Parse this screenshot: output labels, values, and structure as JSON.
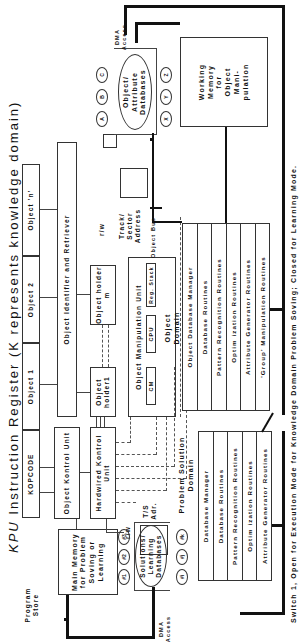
{
  "title": {
    "prefix": "KPU",
    "main": "Instruction Register (K represents knowledge domain)"
  },
  "instruction_register": {
    "fields": [
      "KOPCODE",
      "Object 1",
      "Object 2",
      "Object 'n'"
    ]
  },
  "program_store": {
    "label": "Program Store",
    "main_memory": "Main Memory for Problem Soving or Learning"
  },
  "units": {
    "object_kontrol_unit": "Object Kontrol Unit",
    "hardwired_kontrol_unit": "Hardwired Kontrol Unit",
    "object_identifier": "Object Identifier and Retriever",
    "object_holder_1": "Object holder1",
    "object_holder_m": "Object holder m",
    "object_manipulation_unit": "Object Manipulation Unit",
    "cm": "CM",
    "cpu": "CPU",
    "reg_stack": "Reg. Stack"
  },
  "io_labels": {
    "rw_top": "r/w",
    "track_sector": "Track/ Sector Address",
    "object_bus": "Object Bus",
    "rw_bottom": "r/w",
    "ts_adr": "T/S Adr.",
    "dma_top": "DMA Access",
    "dma_bottom": "DMA Access"
  },
  "object_attribute_db": {
    "label": "Object/ Attribute Databases",
    "ovals_top": [
      "A",
      "B",
      "C"
    ],
    "ovals_bottom": [
      "X",
      "Y",
      "Z"
    ]
  },
  "solutions_db": {
    "label": "Solutions/ Learning Databases",
    "ovals_top": [
      "#1",
      "#2",
      "#3"
    ],
    "ovals_bottom": [
      "#i",
      "#j",
      "#k"
    ]
  },
  "working_memory": {
    "label": "Working Memory for Object Mani-pulation"
  },
  "object_domain": {
    "title": "Object Domain",
    "rows": [
      "Object Database Manager",
      "Database Routines",
      "Pattern Recognition Routines",
      "Optim ization Routines",
      "Attribute Generator Routines",
      "'Group' Manipulation Routines"
    ]
  },
  "problem_solution_domain": {
    "title": "Problem Solution Domain",
    "rows": [
      "Database Manager",
      "Database Routines",
      "Pattern Recognition Routines",
      "Optim ization Routines",
      "Attribute Generator Routines"
    ]
  },
  "caption": "Switch 1, Open for Execution Mode for Knowledge Domain Problem Soving; Closed for Learning Mode."
}
